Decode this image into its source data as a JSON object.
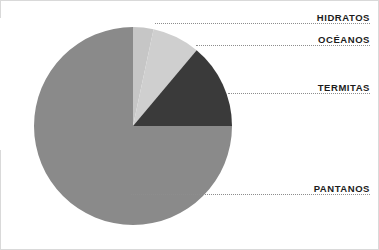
{
  "figure": {
    "background_color": "#ffffff",
    "frame_color": "#d9d9d9",
    "leader_line_color": "#8d8d8d",
    "label_color": "#1c1c1c"
  },
  "chart_data": {
    "type": "pie",
    "title": "",
    "subtitle": "",
    "xlabel": "",
    "ylabel": "",
    "grid": false,
    "legend_position": "callout-labels-right",
    "start_angle_deg": 0,
    "direction": "clockwise",
    "center": {
      "x": 133,
      "y": 126
    },
    "radius": 99,
    "categories": [
      "HIDRATOS",
      "OCÉANOS",
      "TERMITAS",
      "PANTANOS"
    ],
    "values": [
      3.3,
      7.8,
      13.9,
      75.0
    ],
    "angles_deg": [
      12,
      28,
      50,
      270
    ],
    "colors": [
      "#c6c6c6",
      "#cfcfcf",
      "#3a3a3a",
      "#8a8a8a"
    ],
    "slices": [
      {
        "label": "HIDRATOS",
        "value": 3.3,
        "angle_deg": 12,
        "color": "#c6c6c6",
        "label_x": 370,
        "label_y": 12,
        "leader_x": 155,
        "leader_y": 23,
        "leader_width": 215
      },
      {
        "label": "OCÉANOS",
        "value": 7.8,
        "angle_deg": 28,
        "color": "#cfcfcf",
        "label_x": 370,
        "label_y": 34,
        "leader_x": 196,
        "leader_y": 45,
        "leader_width": 174
      },
      {
        "label": "TERMITAS",
        "value": 13.9,
        "angle_deg": 50,
        "color": "#3a3a3a",
        "label_x": 370,
        "label_y": 82,
        "leader_x": 228,
        "leader_y": 93,
        "leader_width": 142
      },
      {
        "label": "PANTANOS",
        "value": 75.0,
        "angle_deg": 270,
        "color": "#8a8a8a",
        "label_x": 370,
        "label_y": 183,
        "leader_x": 131,
        "leader_y": 194,
        "leader_width": 239
      }
    ]
  }
}
